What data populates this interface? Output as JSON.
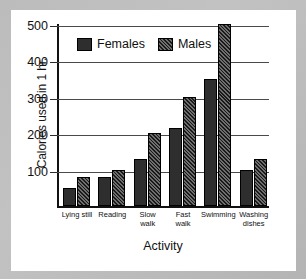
{
  "chart_data": {
    "type": "bar",
    "title": "",
    "xlabel": "Activity",
    "ylabel": "Calories used in 1 hr.",
    "categories": [
      "Lying still",
      "Reading",
      "Slow walk",
      "Fast walk",
      "Swimming",
      "Washing dishes"
    ],
    "series": [
      {
        "name": "Females",
        "values": [
          50,
          80,
          130,
          215,
          350,
          100
        ],
        "color": "#2e2e2e",
        "fill": "solid"
      },
      {
        "name": "Males",
        "values": [
          80,
          100,
          200,
          300,
          500,
          128
        ],
        "color": "#1a1a1a",
        "fill": "diagonal-hatch"
      }
    ],
    "yticks": [
      100,
      200,
      300,
      400,
      500
    ],
    "ylim": [
      0,
      500
    ],
    "grid": true,
    "legend_position": "top-left-inside"
  },
  "legend": {
    "items": [
      {
        "label": "Females"
      },
      {
        "label": "Males"
      }
    ]
  },
  "axis": {
    "y_label": "Calories used in 1 hr.",
    "x_label": "Activity",
    "y_tick_labels": [
      "100",
      "200",
      "300",
      "400",
      "500"
    ]
  },
  "categories": [
    {
      "line1": "Lying still",
      "line2": ""
    },
    {
      "line1": "Reading",
      "line2": ""
    },
    {
      "line1": "Slow",
      "line2": "walk"
    },
    {
      "line1": "Fast",
      "line2": "walk"
    },
    {
      "line1": "Swimming",
      "line2": ""
    },
    {
      "line1": "Washing",
      "line2": "dishes"
    }
  ],
  "colors": {
    "mat": "#bcbcbc",
    "card": "#ffffff",
    "axis": "#111111",
    "grid": "#4a4a4a",
    "female_bar": "#2e2e2e",
    "male_bar": "#1a1a1a"
  }
}
